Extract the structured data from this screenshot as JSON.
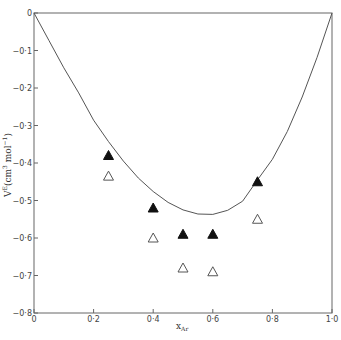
{
  "chart_data": {
    "type": "scatter",
    "title": "",
    "xlabel": "x_Ar",
    "ylabel": "V^E (cm^3 mol^-1)",
    "xlim": [
      0,
      1.0
    ],
    "ylim": [
      -0.8,
      0
    ],
    "grid": false,
    "legend": null,
    "xticks": [
      0,
      0.2,
      0.4,
      0.6,
      0.8,
      1.0
    ],
    "xtick_labels": [
      "0",
      "0·2",
      "0·4",
      "0·6",
      "0·8",
      "1·0"
    ],
    "yticks": [
      0,
      -0.1,
      -0.2,
      -0.3,
      -0.4,
      -0.5,
      -0.6,
      -0.7,
      -0.8
    ],
    "ytick_labels": [
      "0",
      "−0·1",
      "−0·2",
      "−0·3",
      "−0·4",
      "−0·5",
      "−0·6",
      "−0·7",
      "−0·8"
    ],
    "series": [
      {
        "name": "filled triangles",
        "marker": "filled-triangle",
        "x": [
          0.25,
          0.4,
          0.5,
          0.6,
          0.75
        ],
        "y": [
          -0.38,
          -0.52,
          -0.59,
          -0.59,
          -0.45
        ]
      },
      {
        "name": "open triangles",
        "marker": "open-triangle",
        "x": [
          0.25,
          0.4,
          0.5,
          0.6,
          0.75
        ],
        "y": [
          -0.435,
          -0.6,
          -0.68,
          -0.69,
          -0.55
        ]
      },
      {
        "name": "curve",
        "marker": "line",
        "x": [
          0,
          0.05,
          0.1,
          0.15,
          0.2,
          0.25,
          0.3,
          0.35,
          0.4,
          0.45,
          0.5,
          0.55,
          0.6,
          0.65,
          0.7,
          0.75,
          0.8,
          0.85,
          0.9,
          0.95,
          1.0
        ],
        "y": [
          0,
          -0.073,
          -0.146,
          -0.213,
          -0.286,
          -0.343,
          -0.395,
          -0.44,
          -0.476,
          -0.505,
          -0.525,
          -0.536,
          -0.537,
          -0.526,
          -0.502,
          -0.445,
          -0.39,
          -0.316,
          -0.224,
          -0.118,
          0
        ]
      }
    ]
  },
  "caption_fragment": "Fig."
}
